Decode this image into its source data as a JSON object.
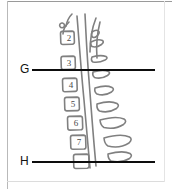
{
  "figure": {
    "kind": "anatomical-line-drawing",
    "background_color": "#ffffff",
    "line_color": "#808080",
    "annotation_color": "#0d0d0d"
  },
  "annotations": [
    {
      "id": "g",
      "label": "G",
      "line_y": 69,
      "line_start_x": 32,
      "line_end_x": 155
    },
    {
      "id": "h",
      "label": "H",
      "line_y": 161,
      "line_start_x": 32,
      "line_end_x": 155
    }
  ],
  "vertebrae": [
    {
      "number": "2",
      "x": 64,
      "y": 40
    },
    {
      "number": "3",
      "x": 64,
      "y": 65
    },
    {
      "number": "4",
      "x": 66,
      "y": 87
    },
    {
      "number": "5",
      "x": 68,
      "y": 106
    },
    {
      "number": "6",
      "x": 71,
      "y": 125
    },
    {
      "number": "7",
      "x": 74,
      "y": 144
    }
  ]
}
